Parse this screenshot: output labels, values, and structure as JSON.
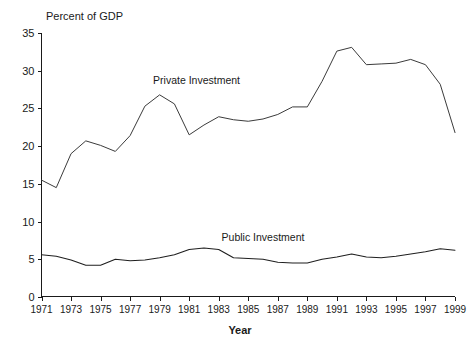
{
  "chart_data": {
    "type": "line",
    "title": "",
    "ylabel": "Percent of GDP",
    "xlabel": "Year",
    "ylim": [
      0,
      35
    ],
    "xlim": [
      1971,
      1999
    ],
    "yticks": [
      "0",
      "5",
      "10",
      "15",
      "20",
      "25",
      "30",
      "35"
    ],
    "ytick_values": [
      0,
      5,
      10,
      15,
      20,
      25,
      30,
      35
    ],
    "xticks": [
      "1971",
      "1973",
      "1975",
      "1977",
      "1979",
      "1981",
      "1983",
      "1985",
      "1987",
      "1989",
      "1991",
      "1993",
      "1995",
      "1997",
      "1999"
    ],
    "xtick_values": [
      1971,
      1973,
      1975,
      1977,
      1979,
      1981,
      1983,
      1985,
      1987,
      1989,
      1991,
      1993,
      1995,
      1997,
      1999
    ],
    "grid": false,
    "legend_position": "inline-annotation",
    "x": [
      1971,
      1972,
      1973,
      1974,
      1975,
      1976,
      1977,
      1978,
      1979,
      1980,
      1981,
      1982,
      1983,
      1984,
      1985,
      1986,
      1987,
      1988,
      1989,
      1990,
      1991,
      1992,
      1993,
      1994,
      1995,
      1996,
      1997,
      1998,
      1999
    ],
    "series": [
      {
        "name": "Private Investment",
        "color": "#3b3b3b",
        "label_x": 1981.5,
        "label_y": 28.2,
        "values": [
          15.5,
          14.5,
          19.0,
          20.7,
          20.1,
          19.3,
          21.4,
          25.3,
          26.8,
          25.6,
          21.5,
          22.8,
          23.9,
          23.5,
          23.3,
          23.6,
          24.2,
          25.2,
          25.2,
          28.6,
          32.6,
          33.1,
          30.8,
          30.9,
          31.0,
          31.5,
          30.8,
          28.2,
          21.8
        ],
        "values_note": "Percent of GDP, read from axis"
      },
      {
        "name": "Public Investment",
        "color": "#1f1f1f",
        "label_x": 1986.0,
        "label_y": 7.4,
        "values": [
          5.6,
          5.4,
          4.9,
          4.2,
          4.2,
          5.0,
          4.8,
          4.9,
          5.2,
          5.6,
          6.3,
          6.5,
          6.3,
          5.2,
          5.1,
          5.0,
          4.6,
          4.5,
          4.5,
          5.0,
          5.3,
          5.7,
          5.3,
          5.2,
          5.4,
          5.7,
          6.0,
          6.4,
          6.2
        ],
        "values_note": "Percent of GDP, read from axis"
      }
    ]
  },
  "annotations": {
    "private_label": "Private Investment",
    "public_label": "Public Investment"
  },
  "axes": {
    "y_axis_title": "Percent of GDP",
    "x_axis_title": "Year"
  }
}
